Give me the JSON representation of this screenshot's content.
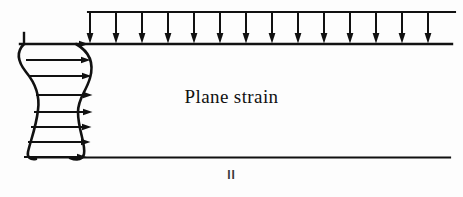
{
  "figure": {
    "title_text": "Plane strain",
    "region_label": "II",
    "stroke_color": "#111111",
    "background_color": "#fdfdfd"
  },
  "geometry": {
    "top_surface_y": 44,
    "bottom_surface_y": 157,
    "load_bar_y": 12,
    "load_span_x_start": 88,
    "load_span_x_end": 455,
    "surface_x_end": 452,
    "profile_x_left": 18,
    "profile_x_right": 88
  },
  "distributed_load": {
    "name": "uniform-pressure",
    "direction": "down",
    "arrow_count": 14,
    "arrow_x_positions": [
      90,
      116,
      142,
      168,
      194,
      220,
      246,
      272,
      298,
      324,
      350,
      376,
      402,
      428
    ],
    "bar_top_y": 12,
    "tip_y": 44
  },
  "velocity_profile": {
    "name": "velocity-field",
    "direction": "right",
    "arrow_count": 8,
    "rows": [
      {
        "y": 44,
        "x_start": 20,
        "x_tip": 88
      },
      {
        "y": 60,
        "x_start": 26,
        "x_tip": 90
      },
      {
        "y": 76,
        "x_start": 30,
        "x_tip": 91
      },
      {
        "y": 95,
        "x_start": 36,
        "x_tip": 92
      },
      {
        "y": 112,
        "x_start": 34,
        "x_tip": 92
      },
      {
        "y": 127,
        "x_start": 31,
        "x_tip": 91
      },
      {
        "y": 142,
        "x_start": 28,
        "x_tip": 90
      },
      {
        "y": 157,
        "x_start": 24,
        "x_tip": 86
      }
    ],
    "left_boundary_path": "M 24 44 C 16 52 18 62 26 72 C 36 84 40 96 38 110 C 36 128 30 142 28 152 C 27 157 30 160 36 159",
    "right_boundary_path": "M 76 44 C 90 52 94 64 90 78 C 86 92 78 98 78 112 C 78 130 86 144 84 154 C 83 159 78 161 70 158",
    "tick_mark": {
      "x": 24,
      "y_top": 33,
      "y_bottom": 44
    }
  }
}
